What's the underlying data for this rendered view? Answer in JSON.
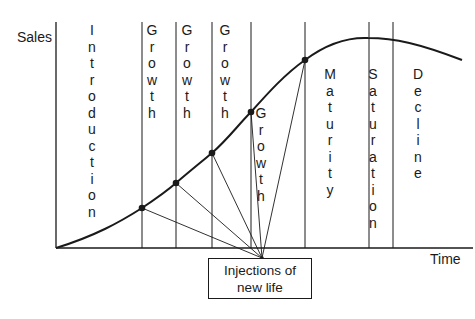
{
  "axes": {
    "y_label": "Sales",
    "x_label": "Time"
  },
  "stages": [
    {
      "label": "Introduction",
      "x": 92,
      "top": 22
    },
    {
      "label": "Growth",
      "x": 152,
      "top": 22
    },
    {
      "label": "Growth",
      "x": 187,
      "top": 22
    },
    {
      "label": "Growth",
      "x": 225,
      "top": 22
    },
    {
      "label": "Growth",
      "x": 261,
      "top": 105
    },
    {
      "label": "Maturity",
      "x": 330,
      "top": 66
    },
    {
      "label": "Saturation",
      "x": 373,
      "top": 66
    },
    {
      "label": "Decline",
      "x": 418,
      "top": 66
    }
  ],
  "injection_points": [
    {
      "x": 142,
      "y": 208
    },
    {
      "x": 176,
      "y": 183
    },
    {
      "x": 212,
      "y": 153
    },
    {
      "x": 251,
      "y": 112
    },
    {
      "x": 305,
      "y": 60
    }
  ],
  "callout": {
    "line1": "Injections of",
    "line2": "new life"
  },
  "colors": {
    "ink": "#1a1a1a",
    "background": "#ffffff"
  }
}
